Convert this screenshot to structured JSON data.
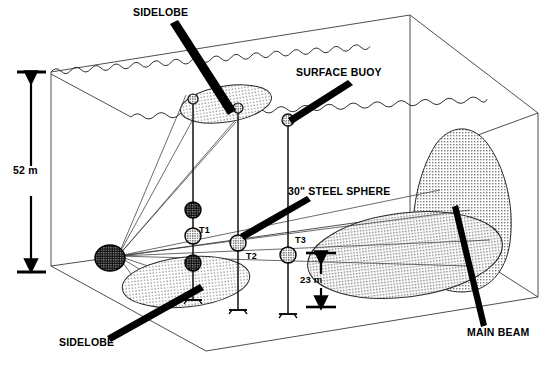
{
  "figure": {
    "kind": "acoustic-beam-pattern-3d-schematic"
  },
  "labels": {
    "sidelobe_top": "SIDELOBE",
    "sidelobe_bottom": "SIDELOBE",
    "surface_buoy": "SURFACE BUOY",
    "steel_sphere": "30\" STEEL SPHERE",
    "main_beam": "MAIN BEAM",
    "depth_52": "52 m",
    "height_23": "23 m",
    "target_1": "T1",
    "target_2": "T2",
    "target_3": "T3"
  },
  "colors": {
    "ink": "#000000",
    "paper": "#ffffff",
    "hatch_fill": "#d8d8d8",
    "source_fill": "#2b2b2b",
    "wire": "#444444"
  },
  "dimensions": {
    "water_depth_label": "52 m",
    "sphere_height_label": "23 m",
    "sphere_size_label": "30\""
  },
  "elements": {
    "source_icon": "acoustic-source-sphere",
    "buoy_icon": "surface-buoy-sphere",
    "anchor_icon": "mooring-anchor",
    "beam_icon": "main-beam-lobe",
    "sidelobe_icon": "sidelobe-ellipse"
  }
}
